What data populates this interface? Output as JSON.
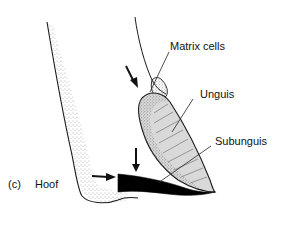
{
  "figure": {
    "panel_label": "(c)",
    "panel_title": "Hoof",
    "labels": {
      "matrix_cells": "Matrix cells",
      "unguis": "Unguis",
      "subunguis": "Subunguis"
    },
    "colors": {
      "outline": "#1a1a1a",
      "stipple": "#555555",
      "unguis_fill": "#d9d9d9",
      "subunguis_fill": "#000000",
      "arrow": "#111111"
    }
  }
}
